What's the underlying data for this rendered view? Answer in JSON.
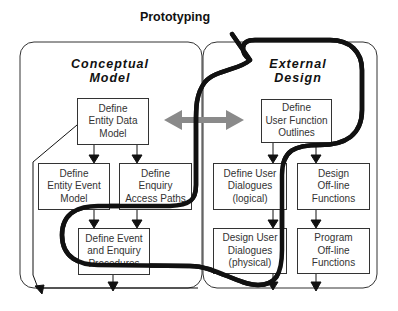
{
  "diagram": {
    "title": "Prototyping",
    "panels": [
      {
        "id": "conceptual",
        "title": "Conceptual\nModel",
        "boxes": [
          {
            "id": "entity-data-model",
            "label": "Define\nEntity Data\nModel"
          },
          {
            "id": "entity-event-model",
            "label": "Define\nEntity Event\nModel"
          },
          {
            "id": "enquiry-access-paths",
            "label": "Define\nEnquiry\nAccess Paths"
          },
          {
            "id": "event-enquiry-procedures",
            "label": "Define Event\nand Enquiry\nProcedures"
          }
        ]
      },
      {
        "id": "external",
        "title": "External\nDesign",
        "boxes": [
          {
            "id": "user-function-outlines",
            "label": "Define\nUser Function\nOutlines"
          },
          {
            "id": "user-dialogues-logical",
            "label": "Define User\nDialogues\n(logical)"
          },
          {
            "id": "design-offline-functions",
            "label": "Design\nOff-line\nFunctions"
          },
          {
            "id": "user-dialogues-physical",
            "label": "Design User\nDialogues\n(physical)"
          },
          {
            "id": "program-offline-functions",
            "label": "Program\nOff-line\nFunctions"
          }
        ]
      }
    ],
    "colors": {
      "line": "#222222",
      "box_border": "#333333",
      "double_arrow": "#8a8a8a",
      "prototyping_path": "#111111"
    }
  }
}
